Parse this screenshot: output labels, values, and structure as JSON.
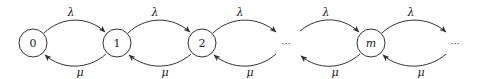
{
  "diagram": {
    "type": "birth-death-chain",
    "colors": {
      "stroke": "#333333",
      "text": "#222222",
      "background": "#ffffff"
    },
    "nodes": [
      {
        "id": "0",
        "label": "0",
        "italic": false
      },
      {
        "id": "1",
        "label": "1",
        "italic": false
      },
      {
        "id": "2",
        "label": "2",
        "italic": false
      },
      {
        "id": "m",
        "label": "m",
        "italic": true
      }
    ],
    "ellipses": [
      {
        "id": "gap-1",
        "label": "···"
      },
      {
        "id": "gap-2",
        "label": "···"
      }
    ],
    "edges": [
      {
        "from": "0",
        "to": "1",
        "label": "λ",
        "direction": "forward"
      },
      {
        "from": "1",
        "to": "0",
        "label": "μ",
        "direction": "backward"
      },
      {
        "from": "1",
        "to": "2",
        "label": "λ",
        "direction": "forward"
      },
      {
        "from": "2",
        "to": "1",
        "label": "μ",
        "direction": "backward"
      },
      {
        "from": "2",
        "to": "gap-1",
        "label": "λ",
        "direction": "forward"
      },
      {
        "from": "gap-1",
        "to": "2",
        "label": "μ",
        "direction": "backward"
      },
      {
        "from": "gap-1",
        "to": "m",
        "label": "λ",
        "direction": "forward"
      },
      {
        "from": "m",
        "to": "gap-1",
        "label": "μ",
        "direction": "backward"
      },
      {
        "from": "m",
        "to": "gap-2",
        "label": "λ",
        "direction": "forward"
      },
      {
        "from": "gap-2",
        "to": "m",
        "label": "μ",
        "direction": "backward"
      }
    ]
  }
}
